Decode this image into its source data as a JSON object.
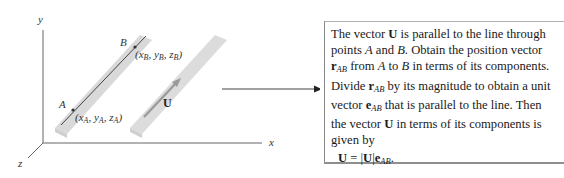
{
  "figure": {
    "axes": {
      "x_label": "x",
      "y_label": "y",
      "z_label": "z"
    },
    "points": [
      {
        "name": "A",
        "coords": {
          "x": "x",
          "y": "y",
          "z": "z",
          "sub": "A"
        }
      },
      {
        "name": "B",
        "coords": {
          "x": "x",
          "y": "y",
          "z": "z",
          "sub": "B"
        }
      }
    ],
    "vector_label": "U",
    "colors": {
      "bar_fill": "#d9d9d9",
      "bar_edge": "#c4c4c4",
      "line": "#333333",
      "axis": "#555555",
      "arrow_in_bar": "#9a9a9a"
    }
  },
  "connector_arrow": {
    "direction": "right"
  },
  "info_box": {
    "text_parts": {
      "t1": "The vector ",
      "U1": "U",
      "t2": " is parallel to the line through points ",
      "A1": "A",
      "t3": " and ",
      "B1": "B",
      "t4": ". Obtain the position vector ",
      "r1": "r",
      "AB1": "AB",
      "t5": " from ",
      "A2": "A",
      "t6": " to ",
      "B2": "B",
      "t7": " in terms of its components. Divide ",
      "r2": "r",
      "AB2": "AB",
      "t8": " by its magnitude to obtain a unit vector ",
      "e1": "e",
      "AB3": "AB",
      "t9": " that is parallel to the line. Then the vector ",
      "U2": "U",
      "t10": " in terms of its components is given by"
    },
    "equation": {
      "lhs": "U",
      "eq": " = |",
      "mag": "U",
      "bar": "|",
      "e": "e",
      "sub": "AB",
      "end": "."
    }
  }
}
